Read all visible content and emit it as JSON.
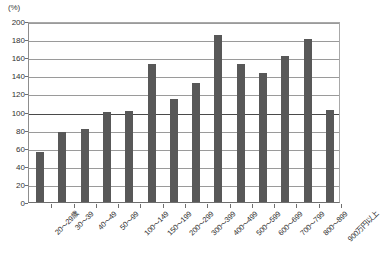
{
  "chart_data": {
    "type": "bar",
    "title": "",
    "subtitle": "",
    "xlabel": "",
    "ylabel": "",
    "unit_label": "(%)",
    "ylim": [
      0,
      200
    ],
    "ytick_step": 20,
    "yticks": [
      "0",
      "20",
      "40",
      "60",
      "80",
      "100",
      "120",
      "140",
      "160",
      "180",
      "200"
    ],
    "grid": true,
    "grid_axis": "y",
    "reference_line": 100,
    "legend": "none",
    "bar_color": "#585858",
    "categories": [
      "20〜29歳",
      "30〜39",
      "40〜49",
      "50〜99",
      "100〜149",
      "150〜199",
      "200〜299",
      "300〜399",
      "400〜499",
      "500〜599",
      "600〜699",
      "700〜799",
      "800〜899",
      "900万円以上"
    ],
    "values": [
      55,
      77,
      81,
      99,
      101,
      152,
      114,
      132,
      185,
      152,
      143,
      161,
      180,
      102
    ]
  }
}
